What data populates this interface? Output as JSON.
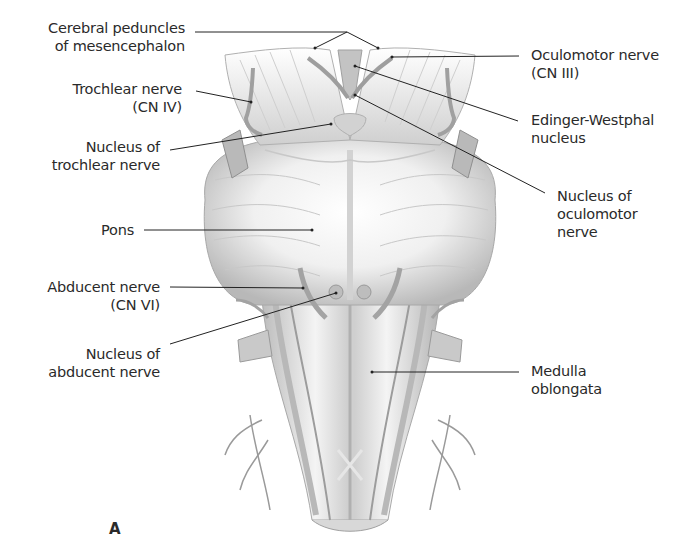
{
  "figure": {
    "panel_letter": "A",
    "colors": {
      "illustration": "#bdbdbd",
      "shade": "#8a8a8a",
      "leader_line": "#222222",
      "text": "#2a2a2a",
      "background": "#ffffff"
    }
  },
  "labels": {
    "cerebral_peduncles": {
      "line1": "Cerebral peduncles",
      "line2": "of mesencephalon"
    },
    "trochlear_nerve": {
      "line1": "Trochlear nerve",
      "line2": "(CN IV)"
    },
    "nucleus_trochlear": {
      "line1": "Nucleus of",
      "line2": "trochlear nerve"
    },
    "pons": {
      "line1": "Pons"
    },
    "abducent_nerve": {
      "line1": "Abducent nerve",
      "line2": "(CN VI)"
    },
    "nucleus_abducent": {
      "line1": "Nucleus of",
      "line2": "abducent nerve"
    },
    "oculomotor_nerve": {
      "line1": "Oculomotor nerve",
      "line2": "(CN III)"
    },
    "edinger_westphal": {
      "line1": "Edinger-Westphal",
      "line2": "nucleus"
    },
    "nucleus_oculomotor": {
      "line1": "Nucleus of",
      "line2": "oculomotor",
      "line3": "nerve"
    },
    "medulla": {
      "line1": "Medulla",
      "line2": "oblongata"
    }
  }
}
